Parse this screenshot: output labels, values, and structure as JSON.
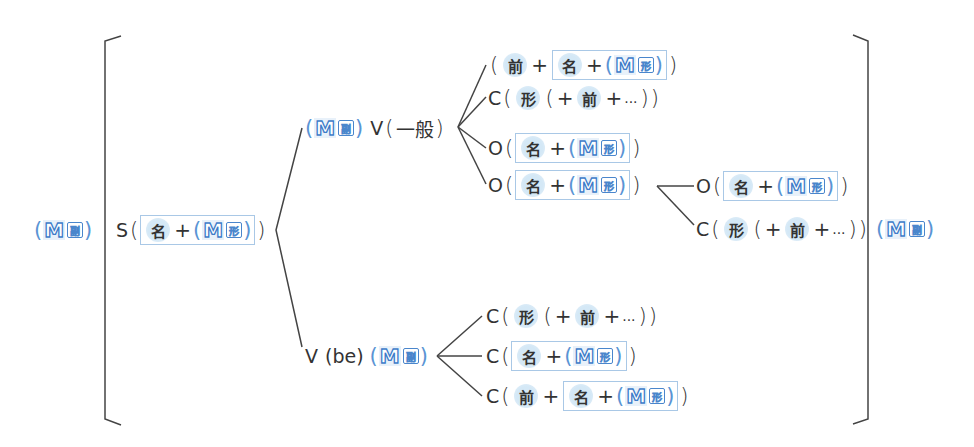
{
  "diagram": {
    "colors": {
      "line": "#444444",
      "accent_blue": "#3d7cc9",
      "chip_bg": "#d4e8f6",
      "box_border": "#a9c8e6"
    },
    "tokens": {
      "modifier_M": "M",
      "adverb_small": "副",
      "adj_small": "形",
      "noun": "名",
      "prep": "前",
      "adj": "形",
      "plus": "+",
      "ellipsis": "...",
      "open_paren": "(",
      "close_paren": ")"
    },
    "left_modifier": {
      "badge": "M",
      "kind": "副"
    },
    "right_modifier": {
      "badge": "M",
      "kind": "副"
    },
    "subject": {
      "label": "S",
      "content": "名+(M形)"
    },
    "branch_general": {
      "pre_modifier": {
        "badge": "M",
        "kind": "副"
      },
      "verb_label": "V",
      "verb_type": "一般",
      "complements": [
        {
          "label": "",
          "content": "前+ 名+(M形)"
        },
        {
          "label": "C",
          "content": "形 (+前+...)"
        },
        {
          "label": "O",
          "content": "名+(M形)"
        },
        {
          "label": "O",
          "content": "名+(M形)",
          "sub": [
            {
              "label": "O",
              "content": "名+(M形)"
            },
            {
              "label": "C",
              "content": "形 (+前+...)"
            }
          ]
        }
      ]
    },
    "branch_be": {
      "verb_label": "V",
      "verb_type": "(be)",
      "post_modifier": {
        "badge": "M",
        "kind": "副"
      },
      "complements": [
        {
          "label": "C",
          "content": "形 (+前+...)"
        },
        {
          "label": "C",
          "content": "名+(M形)"
        },
        {
          "label": "C",
          "content": "前+ 名+(M形)"
        }
      ]
    }
  }
}
